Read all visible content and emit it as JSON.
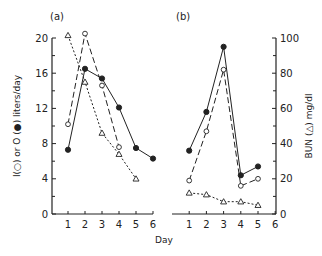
{
  "chart_data": [
    {
      "panel": "(a)",
      "type": "line",
      "x": [
        1,
        2,
        3,
        4,
        5,
        6
      ],
      "xlabel": "Day",
      "ylabel": "I(○) or O (●) liters/day",
      "yticks": [
        0,
        4,
        8,
        12,
        16,
        20
      ],
      "xticks": [
        1,
        2,
        3,
        4,
        5,
        6
      ],
      "ylim": [
        0,
        20
      ],
      "xlim": [
        0,
        6
      ],
      "grid": false,
      "series": [
        {
          "name": "O (output, filled circle)",
          "marker": "filled-circle",
          "line": "solid",
          "x": [
            1,
            2,
            3,
            4,
            5,
            6
          ],
          "values": [
            7.3,
            16.5,
            15.4,
            12.1,
            7.5,
            6.3
          ]
        },
        {
          "name": "I (intake, open circle)",
          "marker": "open-circle",
          "line": "long-dash",
          "x": [
            1,
            2,
            3,
            4
          ],
          "values": [
            10.2,
            20.5,
            14.6,
            7.6
          ]
        },
        {
          "name": "BUN (triangle)",
          "marker": "open-triangle",
          "line": "dotted",
          "x": [
            1,
            2,
            3,
            4,
            5
          ],
          "values": [
            20.3,
            15.0,
            9.2,
            6.8,
            4.0
          ]
        }
      ]
    },
    {
      "panel": "(b)",
      "type": "line",
      "x": [
        1,
        2,
        3,
        4,
        5
      ],
      "xlabel": "Day",
      "ylabel": "BUN (△) mg/dl",
      "yticks": [
        0,
        20,
        40,
        60,
        80,
        100
      ],
      "xticks": [
        1,
        2,
        3,
        4,
        5,
        6
      ],
      "ylim": [
        0,
        100
      ],
      "xlim": [
        0,
        6
      ],
      "yaxis_position": "right",
      "grid": false,
      "series": [
        {
          "name": "O (output, filled circle)",
          "marker": "filled-circle",
          "line": "solid",
          "x": [
            1,
            2,
            3,
            4,
            5
          ],
          "values": [
            36,
            58,
            95,
            22,
            27
          ]
        },
        {
          "name": "I (intake, open circle)",
          "marker": "open-circle",
          "line": "long-dash",
          "x": [
            1,
            2,
            3,
            4,
            5
          ],
          "values": [
            19,
            47,
            82,
            16,
            20
          ]
        },
        {
          "name": "BUN (triangle)",
          "marker": "open-triangle",
          "line": "dotted",
          "x": [
            1,
            2,
            3,
            4,
            5
          ],
          "values": [
            12,
            11,
            7,
            7,
            5
          ]
        }
      ]
    }
  ],
  "labels": {
    "panel_a": "(a)",
    "panel_b": "(b)",
    "xlabel": "Day",
    "left_ylabel": "I(○) or O (●) liters/day",
    "right_ylabel": "BUN (△) mg/dl"
  },
  "colors": {
    "ink": "#222222",
    "background": "#ffffff"
  }
}
